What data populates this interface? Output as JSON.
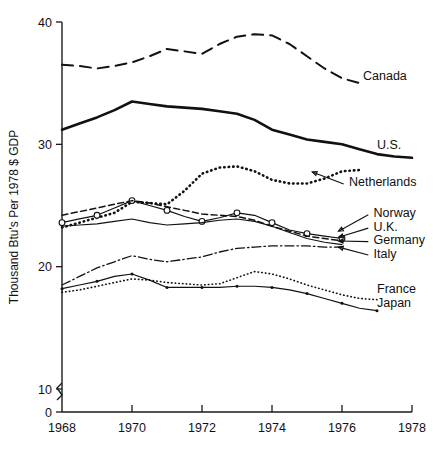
{
  "chart_data": {
    "type": "line",
    "title": "",
    "xlabel": "",
    "ylabel": "Thousand Btu's Per 1978 $ GDP",
    "xlim": [
      1968,
      1978
    ],
    "ylim": [
      0,
      40
    ],
    "y_ticks": [
      0,
      10,
      20,
      30,
      40
    ],
    "x_ticks": [
      1968,
      1970,
      1972,
      1974,
      1976,
      1978
    ],
    "grid": false,
    "legend_position": "right-inline-labels",
    "axis_break": {
      "between": [
        0,
        10
      ],
      "symbol": "zigzag"
    },
    "x": [
      1968,
      1968.5,
      1969,
      1969.5,
      1970,
      1970.5,
      1971,
      1971.5,
      1972,
      1972.5,
      1973,
      1973.5,
      1974,
      1974.5,
      1975,
      1975.5,
      1976,
      1976.5,
      1977,
      1977.5,
      1978
    ],
    "series": [
      {
        "name": "Canada",
        "style": "dashed",
        "values": [
          36.5,
          36.4,
          36.2,
          36.4,
          36.7,
          37.2,
          37.8,
          37.6,
          37.4,
          38.2,
          38.8,
          39.0,
          38.9,
          38.2,
          37.2,
          36.2,
          35.4,
          35.0,
          null,
          null,
          null
        ]
      },
      {
        "name": "U.S.",
        "style": "solid-thick",
        "values": [
          31.2,
          31.7,
          32.2,
          32.8,
          33.5,
          33.3,
          33.1,
          33.0,
          32.9,
          32.7,
          32.5,
          32.0,
          31.2,
          30.8,
          30.4,
          30.2,
          30.0,
          29.6,
          29.2,
          29.0,
          28.9
        ]
      },
      {
        "name": "Netherlands",
        "style": "dotted-bold",
        "values": [
          23.2,
          23.6,
          24.0,
          24.4,
          25.3,
          25.2,
          25.1,
          26.2,
          27.6,
          28.1,
          28.2,
          27.8,
          27.1,
          26.8,
          26.8,
          27.2,
          27.8,
          27.9,
          null,
          null,
          null
        ]
      },
      {
        "name": "Norway",
        "style": "solid-circles",
        "values": [
          23.6,
          23.9,
          24.2,
          24.8,
          25.4,
          25.0,
          24.6,
          24.1,
          23.7,
          24.0,
          24.4,
          24.2,
          23.6,
          23.0,
          22.7,
          22.5,
          22.3,
          null,
          null,
          null,
          null
        ]
      },
      {
        "name": "U.K.",
        "style": "dashed-thin",
        "values": [
          24.2,
          24.5,
          24.8,
          25.1,
          25.4,
          25.2,
          24.9,
          24.6,
          24.3,
          24.2,
          24.1,
          23.8,
          23.3,
          22.9,
          22.5,
          22.3,
          22.1,
          null,
          null,
          null,
          null
        ]
      },
      {
        "name": "Germany",
        "style": "solid-thin",
        "values": [
          23.3,
          23.4,
          23.5,
          23.7,
          23.9,
          23.6,
          23.4,
          23.5,
          23.6,
          23.8,
          23.9,
          23.7,
          23.3,
          22.8,
          22.3,
          22.0,
          21.8,
          null,
          null,
          null,
          null
        ]
      },
      {
        "name": "Italy",
        "style": "dash-dot",
        "values": [
          18.5,
          19.2,
          19.9,
          20.4,
          20.9,
          20.6,
          20.4,
          20.6,
          20.8,
          21.2,
          21.5,
          21.6,
          21.7,
          21.7,
          21.7,
          21.6,
          21.6,
          null,
          null,
          null,
          null
        ]
      },
      {
        "name": "France",
        "style": "dotted-fine",
        "values": [
          17.9,
          18.1,
          18.4,
          18.7,
          19.0,
          18.9,
          18.7,
          18.6,
          18.5,
          18.6,
          19.1,
          19.6,
          19.4,
          19.0,
          18.5,
          18.1,
          17.7,
          17.4,
          17.3,
          null,
          null
        ]
      },
      {
        "name": "Japan",
        "style": "solid-dots",
        "values": [
          18.2,
          18.5,
          18.8,
          19.2,
          19.4,
          18.9,
          18.3,
          18.3,
          18.3,
          18.3,
          18.4,
          18.4,
          18.3,
          18.1,
          17.8,
          17.4,
          17.0,
          16.6,
          16.4,
          null,
          null
        ]
      }
    ],
    "annotations": [
      {
        "label": "Canada",
        "x": 1976.6,
        "y": 35.6
      },
      {
        "label": "U.S.",
        "x": 1977.0,
        "y": 30.0
      },
      {
        "label": "Netherlands",
        "x": 1976.2,
        "y": 27.0
      },
      {
        "label": "Norway",
        "x": 1976.9,
        "y": 24.4
      },
      {
        "label": "U.K.",
        "x": 1976.9,
        "y": 23.3
      },
      {
        "label": "Germany",
        "x": 1976.9,
        "y": 22.2
      },
      {
        "label": "Italy",
        "x": 1976.9,
        "y": 21.1
      },
      {
        "label": "France",
        "x": 1977.0,
        "y": 18.2
      },
      {
        "label": "Japan",
        "x": 1977.0,
        "y": 17.1
      }
    ]
  }
}
